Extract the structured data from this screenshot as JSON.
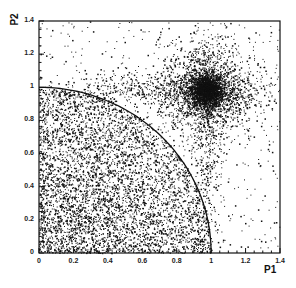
{
  "chart_data": {
    "type": "scatter",
    "title": "",
    "xlabel": "P1",
    "ylabel": "P2",
    "xlim": [
      0,
      1.4
    ],
    "ylim": [
      0,
      1.4
    ],
    "grid": false,
    "legend": null,
    "x_ticks": [
      "0",
      "0.2",
      "0.4",
      "0.6",
      "0.8",
      "1",
      "1.2",
      "1.4"
    ],
    "y_ticks": [
      "0",
      "0.2",
      "0.4",
      "0.6",
      "0.8",
      "1",
      "1.2",
      "1.4"
    ],
    "annotations": [
      {
        "type": "circle-arc",
        "center": [
          0,
          0
        ],
        "radius": 1.0,
        "description": "quarter circle of radius 1 centered at origin"
      }
    ],
    "clusters": [
      {
        "name": "dense peak",
        "center": [
          0.97,
          0.98
        ],
        "spread": 0.05,
        "points": 1800
      },
      {
        "name": "halo around peak",
        "center": [
          0.97,
          0.98
        ],
        "spread": 0.14,
        "points": 1500
      },
      {
        "name": "horizontal band",
        "center": [
          0.75,
          0.98
        ],
        "spread_x": 0.35,
        "spread_y": 0.06,
        "points": 700
      },
      {
        "name": "vertical band",
        "center": [
          0.97,
          0.7
        ],
        "spread_x": 0.05,
        "spread_y": 0.35,
        "points": 500
      },
      {
        "name": "uniform inside circle",
        "region": "P1^2+P2^2<1",
        "points": 3800
      },
      {
        "name": "low-corner excess",
        "center": [
          0.15,
          0.15
        ],
        "spread": 0.25,
        "points": 1200
      },
      {
        "name": "sparse background",
        "region": "full frame",
        "points": 700
      }
    ]
  }
}
